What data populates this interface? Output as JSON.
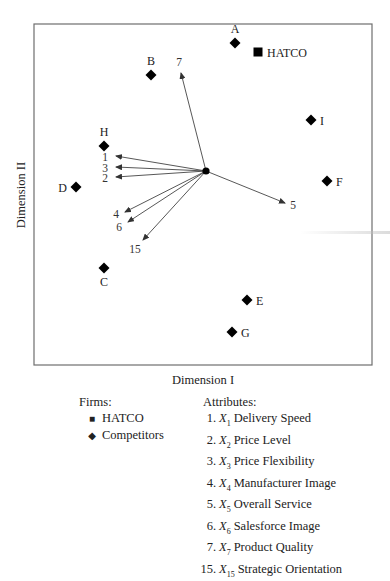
{
  "chart_data": {
    "type": "scatter",
    "title": "",
    "xlabel": "Dimension I",
    "ylabel": "Dimension II",
    "grid": false,
    "legend_position": "bottom",
    "frame": {
      "x1": 34,
      "y1": 24,
      "x2": 372,
      "y2": 365
    },
    "origin": {
      "x": 206,
      "y": 171
    },
    "firms": [
      {
        "id": "A",
        "type": "competitor",
        "x": 235,
        "y": 43,
        "label_pos": "above"
      },
      {
        "id": "HATCO",
        "type": "hatco",
        "x": 258,
        "y": 52,
        "label_pos": "right"
      },
      {
        "id": "B",
        "type": "competitor",
        "x": 151,
        "y": 75,
        "label_pos": "above"
      },
      {
        "id": "I",
        "type": "competitor",
        "x": 311,
        "y": 120,
        "label_pos": "right"
      },
      {
        "id": "H",
        "type": "competitor",
        "x": 104,
        "y": 146,
        "label_pos": "above"
      },
      {
        "id": "F",
        "type": "competitor",
        "x": 327,
        "y": 181,
        "label_pos": "right"
      },
      {
        "id": "D",
        "type": "competitor",
        "x": 76,
        "y": 187,
        "label_pos": "left"
      },
      {
        "id": "C",
        "type": "competitor",
        "x": 104,
        "y": 268,
        "label_pos": "below"
      },
      {
        "id": "E",
        "type": "competitor",
        "x": 247,
        "y": 300,
        "label_pos": "right"
      },
      {
        "id": "G",
        "type": "competitor",
        "x": 232,
        "y": 332,
        "label_pos": "right"
      }
    ],
    "attribute_vectors": [
      {
        "id": "1",
        "tip_x": 116,
        "tip_y": 156,
        "label_x": 105,
        "label_y": 161
      },
      {
        "id": "3",
        "tip_x": 116,
        "tip_y": 167,
        "label_x": 105,
        "label_y": 172
      },
      {
        "id": "2",
        "tip_x": 116,
        "tip_y": 177,
        "label_x": 105,
        "label_y": 182
      },
      {
        "id": "4",
        "tip_x": 125,
        "tip_y": 212,
        "label_x": 116,
        "label_y": 218
      },
      {
        "id": "6",
        "tip_x": 128,
        "tip_y": 222,
        "label_x": 119,
        "label_y": 231
      },
      {
        "id": "15",
        "tip_x": 143,
        "tip_y": 240,
        "label_x": 135,
        "label_y": 253
      },
      {
        "id": "7",
        "tip_x": 181,
        "tip_y": 73,
        "label_x": 179,
        "label_y": 66
      },
      {
        "id": "5",
        "tip_x": 285,
        "tip_y": 203,
        "label_x": 293,
        "label_y": 209
      }
    ]
  },
  "legend": {
    "firms_title": "Firms:",
    "firms": [
      {
        "symbol": "■",
        "label": "HATCO"
      },
      {
        "symbol": "◆",
        "label": "Competitors"
      }
    ],
    "attributes_title": "Attributes:",
    "attributes": [
      {
        "num": "1.",
        "var": "X",
        "sub": "1",
        "label": "Delivery Speed"
      },
      {
        "num": "2.",
        "var": "X",
        "sub": "2",
        "label": "Price Level"
      },
      {
        "num": "3.",
        "var": "X",
        "sub": "3",
        "label": "Price Flexibility"
      },
      {
        "num": "4.",
        "var": "X",
        "sub": "4",
        "label": "Manufacturer Image"
      },
      {
        "num": "5.",
        "var": "X",
        "sub": "5",
        "label": "Overall Service"
      },
      {
        "num": "6.",
        "var": "X",
        "sub": "6",
        "label": "Salesforce Image"
      },
      {
        "num": "7.",
        "var": "X",
        "sub": "7",
        "label": "Product Quality"
      },
      {
        "num": "15.",
        "var": "X",
        "sub": "15",
        "label": "Strategic Orientation"
      }
    ]
  },
  "colors": {
    "frame": "#6e6e6e",
    "marker": "#000000",
    "vector": "#444444",
    "text": "#222222"
  }
}
